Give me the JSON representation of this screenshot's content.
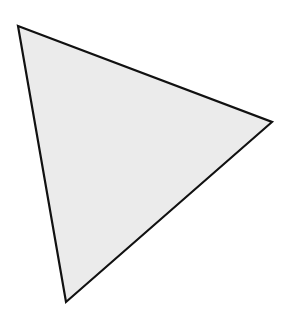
{
  "canvas": {
    "width": 286,
    "height": 321,
    "background": "#ffffff"
  },
  "shape": {
    "type": "triangle",
    "points": [
      [
        18,
        26
      ],
      [
        272,
        122
      ],
      [
        66,
        302
      ]
    ],
    "fill": "#ebebeb",
    "stroke": "#111111",
    "stroke_width": 2.2
  }
}
